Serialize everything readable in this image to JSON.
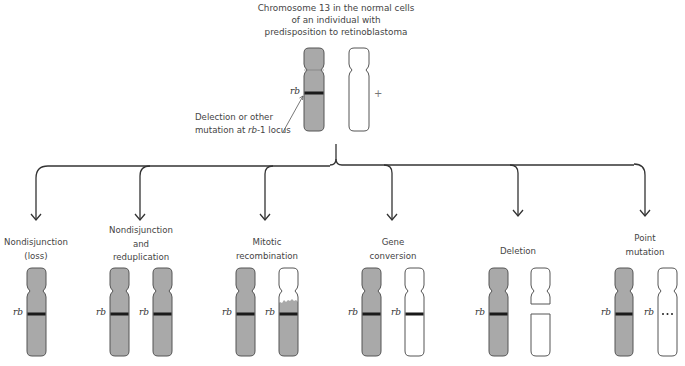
{
  "title": {
    "lines": [
      "Chromosome 13 in the normal cells",
      "of an individual with",
      "predisposition to retinoblastoma"
    ]
  },
  "top": {
    "locus_label": "rb",
    "plus_sign": "+",
    "annotation": {
      "line1": "Delection or other",
      "line2_prefix": "mutation at ",
      "line2_italic": "rb",
      "line2_suffix": "-1 locus"
    }
  },
  "colors": {
    "chromosome_fill": "#a9a9a9",
    "chromosome_stroke": "#555555",
    "band": "#1a1a1a",
    "outline_fill": "#ffffff",
    "arrow": "#333333"
  },
  "panels": [
    {
      "id": "nondisjunction-loss",
      "label_lines": [
        "Nondisjunction",
        "(loss)"
      ],
      "locus_label": "rb"
    },
    {
      "id": "nondisjunction-reduplication",
      "label_lines": [
        "Nondisjunction",
        "and",
        "reduplication"
      ],
      "locus_label": "rb"
    },
    {
      "id": "mitotic-recombination",
      "label_lines": [
        "Mitotic",
        "recombination"
      ],
      "locus_label": "rb"
    },
    {
      "id": "gene-conversion",
      "label_lines": [
        "Gene",
        "conversion"
      ],
      "locus_label": "rb"
    },
    {
      "id": "deletion",
      "label_lines": [
        "Deletion"
      ],
      "locus_label": "rb"
    },
    {
      "id": "point-mutation",
      "label_lines": [
        "Point",
        "mutation"
      ],
      "locus_label": "rb",
      "mutation_marker": "• • •"
    }
  ]
}
